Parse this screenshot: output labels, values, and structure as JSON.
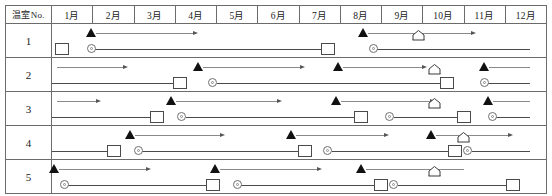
{
  "header": {
    "corner_label": "温室No.",
    "months": [
      "1月",
      "2月",
      "3月",
      "4月",
      "5月",
      "6月",
      "7月",
      "8月",
      "9月",
      "10月",
      "11月",
      "12月"
    ]
  },
  "colors": {
    "grid": "#6b6b6b",
    "thin_line": "#8a8a8a",
    "thick_line": "#4a4a4a",
    "triangle": "#111111",
    "marker_outline": "#6f6f6f",
    "background": "#ffffff"
  },
  "chart_data": {
    "type": "bar",
    "xlabel": "",
    "ylabel": "温室No.",
    "categories": [
      "1月",
      "2月",
      "3月",
      "4月",
      "5月",
      "6月",
      "7月",
      "8月",
      "9月",
      "10月",
      "11月",
      "12月"
    ],
    "x_axis_months": 12,
    "grid": true,
    "legend": null,
    "row_labels": [
      "1",
      "2",
      "3",
      "4",
      "5"
    ],
    "series": [
      {
        "name": "1",
        "row_label": "1",
        "upper_track": [
          {
            "marker": "triangle",
            "start_month": 1.95,
            "end_month": 4.45,
            "arrow": true,
            "house": null
          },
          {
            "marker": "triangle",
            "start_month": 8.55,
            "end_month": 11.2,
            "arrow": true,
            "house": 9.9
          }
        ],
        "lower_track": [
          {
            "marker": "square",
            "month": 1.25
          },
          {
            "marker": "circle",
            "start_month": 1.95,
            "end_month": 7.7,
            "end_marker": "square"
          },
          {
            "marker": "circle",
            "start_month": 8.8,
            "end_month": 12.6,
            "end_marker": null
          }
        ]
      },
      {
        "name": "2",
        "row_label": "2",
        "upper_track": [
          {
            "marker": null,
            "start_month": 1.0,
            "end_month": 2.75,
            "arrow": true,
            "house": null
          },
          {
            "marker": "triangle",
            "start_month": 4.55,
            "end_month": 7.05,
            "arrow": true,
            "house": null
          },
          {
            "marker": "triangle",
            "start_month": 7.95,
            "end_month": 10.0,
            "arrow": true,
            "house": 10.3
          },
          {
            "marker": "triangle",
            "start_month": 11.5,
            "end_month": 12.6,
            "arrow": false,
            "house": null
          }
        ],
        "lower_track": [
          {
            "marker": null,
            "start_month": 1.0,
            "end_month": 4.1,
            "end_marker": "square"
          },
          {
            "marker": "circle",
            "start_month": 4.9,
            "end_month": 10.6,
            "end_marker": "square"
          },
          {
            "marker": "circle",
            "start_month": 11.5,
            "end_month": 12.6,
            "end_marker": null
          }
        ]
      },
      {
        "name": "3",
        "row_label": "3",
        "upper_track": [
          {
            "marker": null,
            "start_month": 1.0,
            "end_month": 2.1,
            "arrow": true,
            "house": null
          },
          {
            "marker": "triangle",
            "start_month": 3.9,
            "end_month": 6.5,
            "arrow": true,
            "house": null
          },
          {
            "marker": "triangle",
            "start_month": 7.9,
            "end_month": 10.2,
            "arrow": true,
            "house": 10.3
          },
          {
            "marker": "triangle",
            "start_month": 11.6,
            "end_month": 12.6,
            "arrow": false,
            "house": null
          }
        ],
        "lower_track": [
          {
            "marker": null,
            "start_month": 1.0,
            "end_month": 3.55,
            "end_marker": "square"
          },
          {
            "marker": "circle",
            "start_month": 4.15,
            "end_month": 8.5,
            "end_marker": "square"
          },
          {
            "marker": "circle",
            "start_month": 9.2,
            "end_month": 11.0,
            "end_marker": "square"
          },
          {
            "marker": "circle",
            "start_month": 11.7,
            "end_month": 12.6,
            "end_marker": null
          }
        ]
      },
      {
        "name": "4",
        "row_label": "4",
        "upper_track": [
          {
            "marker": "triangle",
            "start_month": 2.9,
            "end_month": 5.1,
            "arrow": true,
            "house": null
          },
          {
            "marker": "triangle",
            "start_month": 6.8,
            "end_month": 9.1,
            "arrow": true,
            "house": null
          },
          {
            "marker": "triangle",
            "start_month": 10.2,
            "end_month": 12.1,
            "arrow": true,
            "house": 11.0
          }
        ],
        "lower_track": [
          {
            "marker": null,
            "start_month": 1.0,
            "end_month": 2.5,
            "end_marker": "square"
          },
          {
            "marker": "circle",
            "start_month": 3.1,
            "end_month": 7.15,
            "end_marker": "square"
          },
          {
            "marker": "circle",
            "start_month": 7.7,
            "end_month": 10.8,
            "end_marker": "square"
          },
          {
            "marker": "circle",
            "start_month": 11.1,
            "end_month": 12.6,
            "end_marker": null
          }
        ]
      },
      {
        "name": "5",
        "row_label": "5",
        "upper_track": [
          {
            "marker": "triangle",
            "start_month": 1.05,
            "end_month": 3.3,
            "arrow": true,
            "house": null
          },
          {
            "marker": "triangle",
            "start_month": 4.95,
            "end_month": 7.45,
            "arrow": true,
            "house": null
          },
          {
            "marker": "triangle",
            "start_month": 8.5,
            "end_month": 11.0,
            "arrow": false,
            "house": 10.3
          }
        ],
        "lower_track": [
          {
            "marker": "circle",
            "start_month": 1.3,
            "end_month": 4.9,
            "end_marker": "square"
          },
          {
            "marker": "circle",
            "start_month": 5.5,
            "end_month": 9.0,
            "end_marker": "square"
          },
          {
            "marker": "circle",
            "start_month": 9.3,
            "end_month": 12.2,
            "end_marker": "square"
          }
        ]
      }
    ]
  }
}
